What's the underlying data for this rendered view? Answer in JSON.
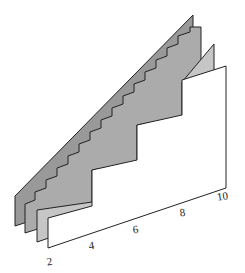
{
  "chart_data": {
    "type": "area",
    "title": "",
    "xlabel": "",
    "ylabel": "",
    "x_axis": {
      "ticks": [
        "2",
        "4",
        "6",
        "8",
        "10"
      ],
      "range": [
        2,
        10
      ]
    },
    "series": [
      {
        "name": "layer-1 (continuous)",
        "fill": "#9a9a9a",
        "steps": 0
      },
      {
        "name": "layer-2 (fine steps)",
        "fill": "#aaaaaa",
        "steps": 8
      },
      {
        "name": "layer-3 (medium steps)",
        "fill": "#c4c4c4",
        "steps": 4
      },
      {
        "name": "layer-4 (coarse steps)",
        "fill": "#ffffff",
        "steps": 2
      }
    ],
    "grid": false,
    "legend": "none"
  },
  "polygons": {
    "layer1": "15,226 15,196 193,15 193,168",
    "layer2": "25,233 25,204 35,200 35,192 46,188 46,180 57,176 57,168 68,164 68,156 79,152 79,144 90,140 90,132 101,128 101,120 112,116 112,108 123,104 123,96 134,92 134,84 145,80 145,72 156,68 156,60 167,56 167,48 178,44 178,36 190,32 190,27 201,27 201,177",
    "layer3": "37,242 37,210 92,202 92,170 137,162 137,125 182,117 182,82 214,44 214,182",
    "layer4": "48,248 48,218 92,206 92,170 137,160 137,125 182,115 182,80 226,66 226,188"
  },
  "tick_positions": [
    {
      "label": "2",
      "x": 50,
      "y": 265
    },
    {
      "label": "4",
      "x": 92,
      "y": 249
    },
    {
      "label": "6",
      "x": 136,
      "y": 233
    },
    {
      "label": "8",
      "x": 183,
      "y": 216
    },
    {
      "label": "10",
      "x": 223,
      "y": 200
    }
  ]
}
